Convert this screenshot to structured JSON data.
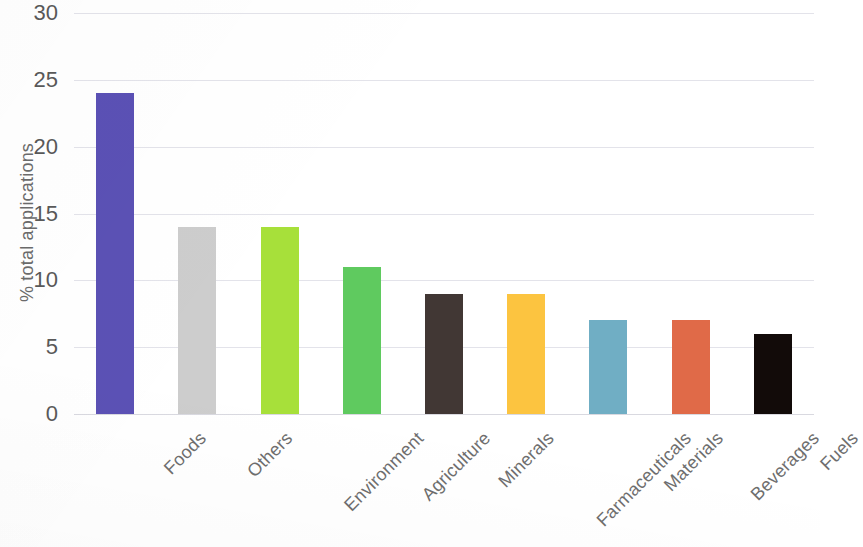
{
  "chart_data": {
    "type": "bar",
    "title": "",
    "subtitle": "",
    "xlabel": "",
    "ylabel": "% total applications",
    "categories": [
      "Foods",
      "Others",
      "Environment",
      "Agriculture",
      "Minerals",
      "Farmaceuticals",
      "Materials",
      "Beverages",
      "Fuels"
    ],
    "values": [
      24,
      14,
      14,
      11,
      9,
      9,
      7,
      7,
      6
    ],
    "colors": [
      "#5b51b5",
      "#cdcdcd",
      "#a7e03a",
      "#5fca5f",
      "#413734",
      "#fcc440",
      "#70aec4",
      "#e06a48",
      "#120b09"
    ],
    "ylim": [
      0,
      30
    ],
    "ytick_step": 5,
    "ytick_labels": [
      "30",
      "25",
      "20",
      "15",
      "10",
      "5",
      "0"
    ],
    "ytick_values": [
      30,
      25,
      20,
      15,
      10,
      5,
      0
    ],
    "grid": true,
    "grid_axis": "y",
    "legend": false,
    "legend_position": "none",
    "xlabel_rotation": -45,
    "background_color": "#ffffff",
    "grid_color": "#e3e3ea",
    "text_color": "#5a5a5a"
  }
}
